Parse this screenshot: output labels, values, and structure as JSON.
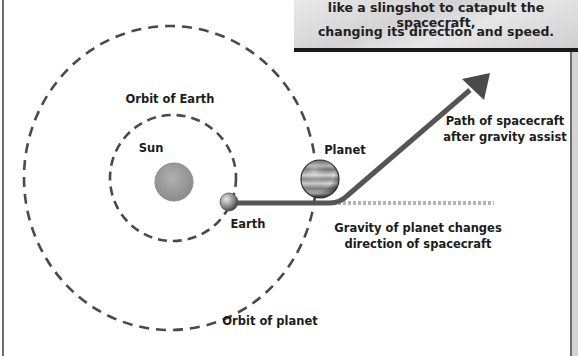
{
  "caption": {
    "lines": [
      "like a slingshot to catapult the spacecraft,",
      "changing its direction and speed."
    ]
  },
  "labels": {
    "orbit_of_earth": "Orbit of Earth",
    "sun": "Sun",
    "earth": "Earth",
    "planet": "Planet",
    "orbit_of_planet": "Orbit of planet",
    "path_after_line1": "Path of spacecraft",
    "path_after_line2": "after gravity assist",
    "gravity_line1": "Gravity of planet changes",
    "gravity_line2": "direction of spacecraft"
  },
  "colors": {
    "orbit_dash": "#4a4a4a",
    "path": "#555555",
    "dotted_original_path": "#b5b5b5",
    "sun": "#9a9a9a"
  }
}
